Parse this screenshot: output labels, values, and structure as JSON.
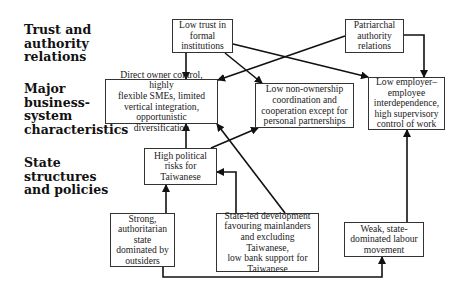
{
  "rows": [
    {
      "id": "trust",
      "label": "Trust and\nauthority\nrelations"
    },
    {
      "id": "business",
      "label": "Major\nbusiness-\nsystem\ncharacteristics"
    },
    {
      "id": "state",
      "label": "State\nstructures\nand policies"
    }
  ],
  "nodes": {
    "low_trust": "Low trust in\nformal\ninstitutions",
    "patriarchal": "Patriarchal\nauthority\nrelations",
    "direct_owner": "Direct owner control, highly\nflexible SMEs, limited\nvertical integration,\nopportunistic diversification",
    "low_non_ownership": "Low non-ownership\ncoordination and\ncooperation except for\npersonal partnerships",
    "low_employer": "Low employer–\nemployee\ninterdependence,\nhigh supervisory\ncontrol of work",
    "high_political": "High political\nrisks for\nTaiwanese",
    "strong_state": "Strong,\nauthoritarian\nstate\ndominated by\noutsiders",
    "state_led": "State-led development\nfavouring mainlanders\nand excluding Taiwanese,\nlow bank support for\nTaiwanese",
    "weak_labour": "Weak, state-\ndominated labour\nmovement"
  },
  "edges": [
    {
      "from": "low_trust",
      "to": "direct_owner"
    },
    {
      "from": "low_trust",
      "to": "low_non_ownership"
    },
    {
      "from": "low_trust",
      "to": "low_employer"
    },
    {
      "from": "patriarchal",
      "to": "direct_owner"
    },
    {
      "from": "patriarchal",
      "to": "low_employer"
    },
    {
      "from": "high_political",
      "to": "direct_owner"
    },
    {
      "from": "high_political",
      "to": "low_non_ownership"
    },
    {
      "from": "strong_state",
      "to": "high_political"
    },
    {
      "from": "strong_state",
      "to": "weak_labour"
    },
    {
      "from": "state_led",
      "to": "high_political"
    },
    {
      "from": "state_led",
      "to": "direct_owner"
    },
    {
      "from": "weak_labour",
      "to": "low_employer"
    }
  ]
}
